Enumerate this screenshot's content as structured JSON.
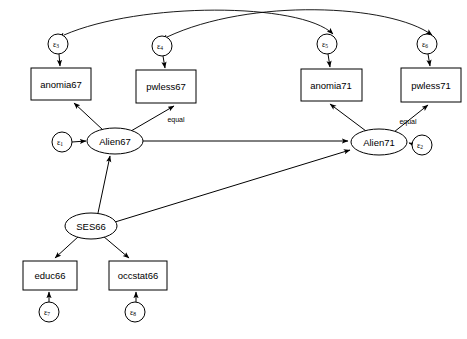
{
  "diagram": {
    "type": "sem-path-diagram",
    "title": "",
    "background_color": "#ffffff",
    "stroke_color": "#000000",
    "fill_color": "#ffffff",
    "width": 467,
    "height": 339
  },
  "latent_variables": [
    {
      "id": "alien67",
      "label": "Alien67",
      "shape": "ellipse",
      "cx": 115,
      "cy": 141,
      "rx": 28,
      "ry": 13
    },
    {
      "id": "alien71",
      "label": "Alien71",
      "shape": "ellipse",
      "cx": 379,
      "cy": 142,
      "rx": 28,
      "ry": 13
    },
    {
      "id": "ses66",
      "label": "SES66",
      "shape": "ellipse",
      "cx": 91,
      "cy": 226,
      "rx": 26,
      "ry": 13
    }
  ],
  "observed_variables": [
    {
      "id": "anomia67",
      "label": "anomia67",
      "shape": "rect",
      "x": 31,
      "y": 68,
      "w": 60,
      "h": 32
    },
    {
      "id": "pwless67",
      "label": "pwless67",
      "shape": "rect",
      "x": 136,
      "y": 70,
      "w": 60,
      "h": 33
    },
    {
      "id": "anomia71",
      "label": "anomia71",
      "shape": "rect",
      "x": 301,
      "y": 69,
      "w": 61,
      "h": 32
    },
    {
      "id": "pwless71",
      "label": "pwless71",
      "shape": "rect",
      "x": 401,
      "y": 68,
      "w": 60,
      "h": 34
    },
    {
      "id": "educ66",
      "label": "educ66",
      "shape": "rect",
      "x": 23,
      "y": 261,
      "w": 54,
      "h": 29
    },
    {
      "id": "occstat66",
      "label": "occstat66",
      "shape": "rect",
      "x": 109,
      "y": 261,
      "w": 58,
      "h": 29
    }
  ],
  "error_terms": [
    {
      "id": "e1",
      "symbol": "ε",
      "subscript": "1",
      "cx": 62,
      "cy": 142,
      "r": 10
    },
    {
      "id": "e2",
      "symbol": "ε",
      "subscript": "2",
      "cx": 422,
      "cy": 145,
      "r": 10
    },
    {
      "id": "e3",
      "symbol": "ε",
      "subscript": "3",
      "cx": 58,
      "cy": 44,
      "r": 10
    },
    {
      "id": "e4",
      "symbol": "ε",
      "subscript": "4",
      "cx": 162,
      "cy": 46,
      "r": 10
    },
    {
      "id": "e5",
      "symbol": "ε",
      "subscript": "5",
      "cx": 327,
      "cy": 44,
      "r": 10
    },
    {
      "id": "e6",
      "symbol": "ε",
      "subscript": "6",
      "cx": 427,
      "cy": 44,
      "r": 10
    },
    {
      "id": "e7",
      "symbol": "ε",
      "subscript": "7",
      "cx": 49,
      "cy": 312,
      "r": 10
    },
    {
      "id": "e8",
      "symbol": "ε",
      "subscript": "8",
      "cx": 135,
      "cy": 312,
      "r": 10
    }
  ],
  "edge_labels": [
    {
      "id": "equal67",
      "label": "equal",
      "x": 176,
      "y": 120
    },
    {
      "id": "equal71",
      "label": "equal",
      "x": 408,
      "y": 122
    }
  ],
  "directed_paths": [
    {
      "from": "alien67",
      "to": "anomia67",
      "label": ""
    },
    {
      "from": "alien67",
      "to": "pwless67",
      "label": "equal"
    },
    {
      "from": "alien71",
      "to": "anomia71",
      "label": ""
    },
    {
      "from": "alien71",
      "to": "pwless71",
      "label": "equal"
    },
    {
      "from": "ses66",
      "to": "educ66",
      "label": ""
    },
    {
      "from": "ses66",
      "to": "occstat66",
      "label": ""
    },
    {
      "from": "ses66",
      "to": "alien67",
      "label": ""
    },
    {
      "from": "ses66",
      "to": "alien71",
      "label": ""
    },
    {
      "from": "alien67",
      "to": "alien71",
      "label": ""
    },
    {
      "from": "e1",
      "to": "alien67",
      "label": ""
    },
    {
      "from": "e2",
      "to": "alien71",
      "label": ""
    },
    {
      "from": "e3",
      "to": "anomia67",
      "label": ""
    },
    {
      "from": "e4",
      "to": "pwless67",
      "label": ""
    },
    {
      "from": "e5",
      "to": "anomia71",
      "label": ""
    },
    {
      "from": "e6",
      "to": "pwless71",
      "label": ""
    },
    {
      "from": "e7",
      "to": "educ66",
      "label": ""
    },
    {
      "from": "e8",
      "to": "occstat66",
      "label": ""
    }
  ],
  "correlated_errors": [
    {
      "from": "e3",
      "to": "e5",
      "style": "double-headed-arc"
    },
    {
      "from": "e4",
      "to": "e6",
      "style": "double-headed-arc"
    }
  ]
}
